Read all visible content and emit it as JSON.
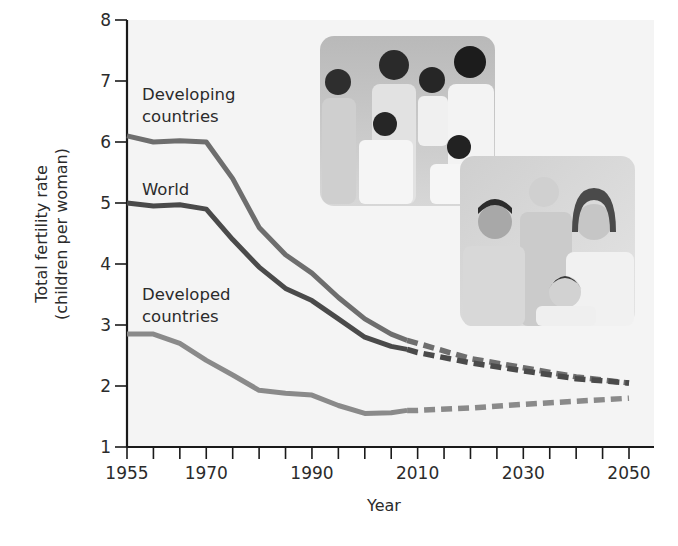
{
  "chart_data": {
    "type": "line",
    "title": "",
    "xlabel": "Year",
    "ylabel": "Total fertility rate (children per woman)",
    "ylabel_lines": [
      "Total fertility rate",
      "(children per woman)"
    ],
    "xlim": [
      1955,
      2050
    ],
    "ylim": [
      1,
      8
    ],
    "x_tick_labels": [
      "1955",
      "1970",
      "1990",
      "2010",
      "2030",
      "2050"
    ],
    "x_tick_values": [
      1955,
      1970,
      1990,
      2010,
      2030,
      2050
    ],
    "x_minor_tick_step": 5,
    "y_tick_labels": [
      "1",
      "2",
      "3",
      "4",
      "5",
      "6",
      "7",
      "8"
    ],
    "y_tick_values": [
      1,
      2,
      3,
      4,
      5,
      6,
      7,
      8
    ],
    "grid": false,
    "legend": "inline labels",
    "series": [
      {
        "name": "Developing countries",
        "label_lines": [
          "Developing",
          "countries"
        ],
        "color": "#6e6e6e",
        "x": [
          1955,
          1960,
          1965,
          1970,
          1975,
          1980,
          1985,
          1990,
          1995,
          2000,
          2005,
          2008
        ],
        "values": [
          6.1,
          6.0,
          6.02,
          6.0,
          5.4,
          4.6,
          4.15,
          3.85,
          3.45,
          3.1,
          2.85,
          2.75
        ],
        "projection_x": [
          2008,
          2010,
          2020,
          2030,
          2040,
          2050
        ],
        "projection_values": [
          2.75,
          2.7,
          2.45,
          2.3,
          2.15,
          2.05
        ]
      },
      {
        "name": "World",
        "label_lines": [
          "World"
        ],
        "color": "#4a4a4a",
        "x": [
          1955,
          1960,
          1965,
          1970,
          1975,
          1980,
          1985,
          1990,
          1995,
          2000,
          2005,
          2008
        ],
        "values": [
          5.0,
          4.95,
          4.97,
          4.9,
          4.4,
          3.95,
          3.6,
          3.4,
          3.1,
          2.8,
          2.65,
          2.6
        ],
        "projection_x": [
          2008,
          2010,
          2020,
          2030,
          2040,
          2050
        ],
        "projection_values": [
          2.6,
          2.55,
          2.38,
          2.25,
          2.12,
          2.05
        ]
      },
      {
        "name": "Developed countries",
        "label_lines": [
          "Developed",
          "countries"
        ],
        "color": "#8a8a8a",
        "x": [
          1955,
          1960,
          1965,
          1970,
          1975,
          1980,
          1985,
          1990,
          1995,
          2000,
          2005,
          2008
        ],
        "values": [
          2.85,
          2.85,
          2.7,
          2.42,
          2.18,
          1.93,
          1.88,
          1.85,
          1.68,
          1.55,
          1.56,
          1.6
        ],
        "projection_x": [
          2008,
          2010,
          2020,
          2030,
          2040,
          2050
        ],
        "projection_values": [
          1.6,
          1.6,
          1.64,
          1.7,
          1.75,
          1.8
        ]
      }
    ],
    "annotations": [
      "Photo: family of seven (developing country)",
      "Photo: family of four (developed country)"
    ]
  },
  "photos": [
    {
      "name": "developing-family-photo",
      "description": "Large family: two adults and five children"
    },
    {
      "name": "developed-family-photo",
      "description": "Small family: two adults and two children"
    }
  ]
}
